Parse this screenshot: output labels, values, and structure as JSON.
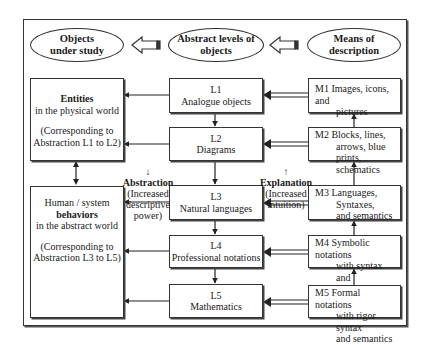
{
  "header": {
    "ellipses": [
      {
        "id": "objects",
        "line1": "Objects",
        "line2": "under study"
      },
      {
        "id": "abstract",
        "line1": "Abstract levels of",
        "line2": "objects"
      },
      {
        "id": "means",
        "line1": "Means of",
        "line2": "description"
      }
    ]
  },
  "left": {
    "entities": {
      "title": "Entities",
      "subtitle": "in the physical world",
      "note1": "(Corresponding to",
      "note2": "Abstraction L1 to L2)"
    },
    "behaviors": {
      "line1": "Human / system",
      "title": "behaviors",
      "subtitle": "in the abstract world",
      "note1": "(Corresponding to",
      "note2": "Abstraction L3 to L5)"
    }
  },
  "levels": [
    {
      "code": "L1",
      "label": "Analogue objects"
    },
    {
      "code": "L2",
      "label": "Diagrams"
    },
    {
      "code": "L3",
      "label": "Natural languages"
    },
    {
      "code": "L4",
      "label": "Professional notations"
    },
    {
      "code": "L5",
      "label": "Mathematics"
    }
  ],
  "means": [
    {
      "code": "M1",
      "line1": "Images, icons, and",
      "line2": "pictures",
      "line3": ""
    },
    {
      "code": "M2",
      "line1": "Blocks, lines,",
      "line2": "arrows, blue prints,",
      "line3": "schematics"
    },
    {
      "code": "M3",
      "line1": "Languages,",
      "line2": "Syntaxes,",
      "line3": "and semantics"
    },
    {
      "code": "M4",
      "line1": "Symbolic notations",
      "line2": "with syntax and",
      "line3": "semantics"
    },
    {
      "code": "M5",
      "line1": "Formal notations",
      "line2": "with rigor syntax",
      "line3": "and semantics"
    }
  ],
  "annotations": {
    "abstraction": {
      "arrow": "↓",
      "title": "Abstraction",
      "line1": "(Increased",
      "line2": "descriptive",
      "line3": "power)"
    },
    "explanation": {
      "arrow": "↑",
      "title": "Explanation",
      "line1": "(Increased",
      "line2": "intuition)"
    }
  }
}
